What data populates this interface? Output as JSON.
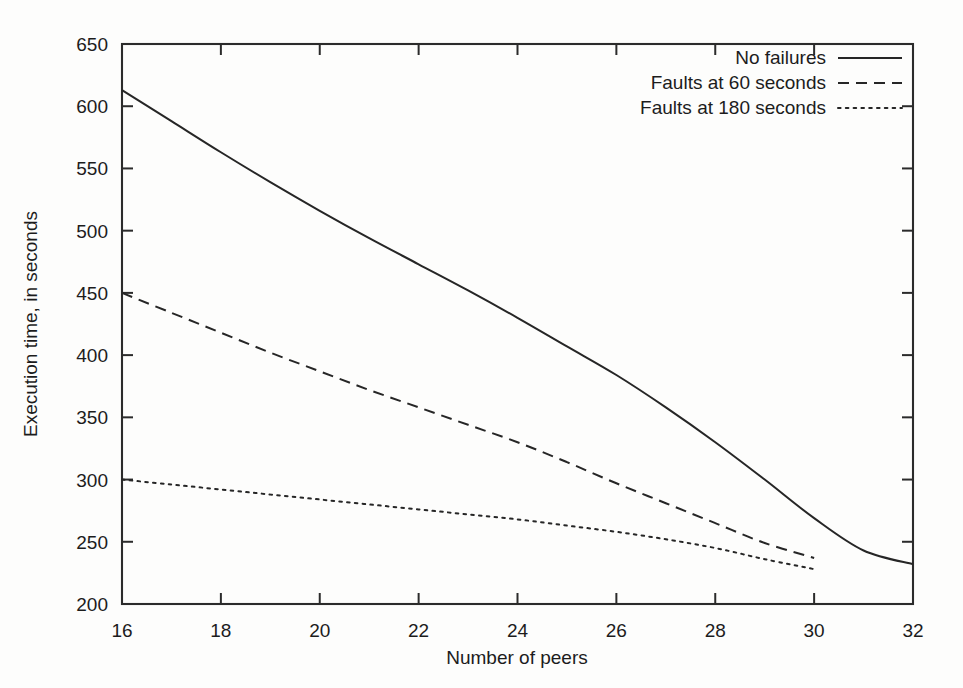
{
  "chart_data": {
    "type": "line",
    "title": "",
    "xlabel": "Number of peers",
    "ylabel": "Execution time, in seconds",
    "xlim": [
      16,
      32
    ],
    "ylim": [
      200,
      650
    ],
    "xticks": [
      16,
      18,
      20,
      22,
      24,
      26,
      28,
      30,
      32
    ],
    "xtick_labels": [
      "16",
      "18",
      "20",
      "22",
      "24",
      "26",
      "28",
      "30",
      "32"
    ],
    "yticks": [
      200,
      250,
      300,
      350,
      400,
      450,
      500,
      550,
      600,
      650
    ],
    "ytick_labels": [
      "200",
      "250",
      "300",
      "350",
      "400",
      "450",
      "500",
      "550",
      "600",
      "650"
    ],
    "grid": false,
    "legend_position": "top-right inside",
    "frame": "box",
    "series": [
      {
        "name": "No failures",
        "style": "solid",
        "color": "#262626",
        "x": [
          16,
          17,
          18,
          19,
          20,
          21,
          22,
          23,
          24,
          25,
          26,
          27,
          28,
          29,
          30,
          31,
          32
        ],
        "values": [
          613,
          588,
          563,
          539,
          516,
          494,
          473,
          452,
          430,
          407,
          384,
          358,
          330,
          300,
          269,
          243,
          232
        ]
      },
      {
        "name": "Faults at 60 seconds",
        "style": "dashed",
        "color": "#262626",
        "x": [
          16,
          17,
          18,
          19,
          20,
          21,
          22,
          23,
          24,
          25,
          26,
          27,
          28,
          29,
          30
        ],
        "values": [
          450,
          434,
          418,
          402,
          387,
          372,
          358,
          344,
          330,
          314,
          297,
          281,
          265,
          249,
          237
        ]
      },
      {
        "name": "Faults at 180 seconds",
        "style": "dotted",
        "color": "#262626",
        "x": [
          16,
          17,
          18,
          19,
          20,
          21,
          22,
          23,
          24,
          25,
          26,
          27,
          28,
          29,
          30
        ],
        "values": [
          300,
          296,
          292,
          288,
          284,
          280,
          276,
          272,
          268,
          263,
          258,
          252,
          245,
          236,
          228
        ]
      }
    ]
  },
  "axes": {
    "x_title": "Number of peers",
    "y_title": "Execution time, in seconds"
  },
  "legend": {
    "entries": [
      {
        "label": "No failures",
        "style": "solid"
      },
      {
        "label": "Faults at 60 seconds",
        "style": "dashed"
      },
      {
        "label": "Faults at 180 seconds",
        "style": "dotted"
      }
    ]
  },
  "colors": {
    "ink": "#262626",
    "axis": "#2b2b2b",
    "background": "#fdfdfc"
  }
}
